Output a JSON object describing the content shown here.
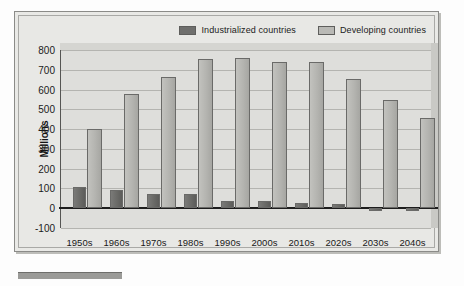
{
  "figure": {
    "y_axis_title": "Millions"
  },
  "legend": {
    "items": [
      {
        "label": "Industrialized countries",
        "color": "#6f6f6d",
        "swatch_icon": "legend-swatch-icon"
      },
      {
        "label": "Developing countries",
        "color": "#b9b9b5",
        "swatch_icon": "legend-swatch-icon"
      }
    ]
  },
  "chart_data": {
    "type": "bar",
    "title": "",
    "xlabel": "",
    "ylabel": "Millions",
    "ylim": [
      -100,
      800
    ],
    "ytick_step": 100,
    "yticks": [
      "800",
      "700",
      "600",
      "500",
      "400",
      "300",
      "200",
      "100",
      "0",
      "-100"
    ],
    "grid": true,
    "legend_position": "top-right",
    "categories": [
      "1950s",
      "1960s",
      "1970s",
      "1980s",
      "1990s",
      "2000s",
      "2010s",
      "2020s",
      "2030s",
      "2040s"
    ],
    "series": [
      {
        "name": "Industrialized countries",
        "color": "#6f6f6d",
        "values": [
          105,
          92,
          72,
          70,
          38,
          35,
          25,
          20,
          -12,
          -15
        ]
      },
      {
        "name": "Developing countries",
        "color": "#b9b9b5",
        "values": [
          400,
          580,
          665,
          757,
          762,
          738,
          737,
          655,
          545,
          458
        ]
      }
    ]
  }
}
